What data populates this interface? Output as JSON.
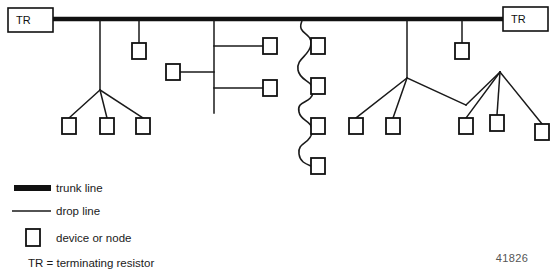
{
  "figure": {
    "number": "41826",
    "top_cropped_caption": ""
  },
  "terminators": {
    "symbol": "TR",
    "left": {
      "label": "TR",
      "x": 8,
      "y": 8,
      "w": 45,
      "h": 24
    },
    "right": {
      "label": "TR",
      "x": 503,
      "y": 7,
      "w": 45,
      "h": 24
    }
  },
  "trunk": {
    "y": 19,
    "x_start": 52,
    "x_end": 504,
    "thickness": 4,
    "color": "#111111"
  },
  "colors": {
    "line": "#111111",
    "drop_line": "#1a1a1a",
    "box_stroke": "#111111",
    "box_fill": "#ffffff",
    "background": "#ffffff",
    "figure_number": "#555555"
  },
  "node_box": {
    "w": 14,
    "h": 16
  },
  "nodes": [
    {
      "id": "n1",
      "x": 62,
      "y": 118
    },
    {
      "id": "n2",
      "x": 100,
      "y": 118
    },
    {
      "id": "n3",
      "x": 136,
      "y": 118
    },
    {
      "id": "n4",
      "x": 132,
      "y": 43
    },
    {
      "id": "n5",
      "x": 166,
      "y": 64
    },
    {
      "id": "n6",
      "x": 263,
      "y": 38
    },
    {
      "id": "n7",
      "x": 263,
      "y": 80
    },
    {
      "id": "n8",
      "x": 311,
      "y": 38
    },
    {
      "id": "n9",
      "x": 311,
      "y": 78
    },
    {
      "id": "n10",
      "x": 311,
      "y": 118
    },
    {
      "id": "n11",
      "x": 311,
      "y": 158
    },
    {
      "id": "n12",
      "x": 349,
      "y": 118
    },
    {
      "id": "n13",
      "x": 386,
      "y": 118
    },
    {
      "id": "n14",
      "x": 455,
      "y": 43
    },
    {
      "id": "n15",
      "x": 459,
      "y": 118
    },
    {
      "id": "n16",
      "x": 490,
      "y": 115
    },
    {
      "id": "n17",
      "x": 535,
      "y": 124
    }
  ],
  "drop_lines": [
    {
      "name": "left-three-way-stem",
      "points": "100,21 100,90"
    },
    {
      "name": "left-three-way-branch-a",
      "points": "100,90 69,118"
    },
    {
      "name": "left-three-way-branch-b",
      "points": "100,90 107,118"
    },
    {
      "name": "left-three-way-branch-c",
      "points": "100,90 143,118"
    },
    {
      "name": "single-drop-n4",
      "points": "139,21 139,43"
    },
    {
      "name": "center-t-stem",
      "points": "214,21 214,113"
    },
    {
      "name": "center-t-branch-upper",
      "points": "214,46 263,46"
    },
    {
      "name": "center-t-branch-left",
      "points": "214,72 180,72"
    },
    {
      "name": "center-t-branch-lower",
      "points": "214,88 263,88"
    },
    {
      "name": "right-tree-stem",
      "points": "407,21 407,78"
    },
    {
      "name": "right-tree-branch-left",
      "points": "407,78 356,118"
    },
    {
      "name": "right-tree-branch-leftmid",
      "points": "407,78 393,118"
    },
    {
      "name": "right-tree-branch-right",
      "points": "407,78 466,105"
    },
    {
      "name": "right-subtree-span",
      "points": "466,105 500,72"
    },
    {
      "name": "right-subtree-branch-a",
      "points": "500,72 466,118"
    },
    {
      "name": "right-subtree-branch-b",
      "points": "500,72 497,115"
    },
    {
      "name": "right-subtree-branch-c",
      "points": "500,72 542,124"
    },
    {
      "name": "single-drop-n14",
      "points": "462,21 462,43"
    }
  ],
  "daisy_chain": {
    "name": "curved-daisy-chain",
    "anchor_x": 311,
    "path": "M 302,21 C 296,34 312,32 311,44 C 310,56 296,58 298,70 C 300,82 314,80 313,92 C 312,104 296,100 299,112 C 301,122 313,120 312,132 C 311,144 297,142 299,154 C 300,162 306,164 311,166"
  },
  "legend": {
    "items": [
      {
        "id": "trunk-line",
        "label": "trunk line",
        "swatch": "thick-line"
      },
      {
        "id": "drop-line",
        "label": "drop line",
        "swatch": "thin-line"
      },
      {
        "id": "device-or-node",
        "label": "device or node",
        "swatch": "box"
      },
      {
        "id": "terminating-resistor",
        "label": "TR = terminating resistor",
        "swatch": "none"
      }
    ]
  }
}
